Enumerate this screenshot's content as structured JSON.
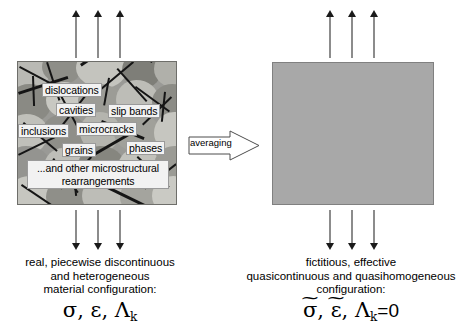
{
  "diagram": {
    "averaging_arrow": {
      "label": "averaging"
    },
    "left_panel": {
      "name": "micrograph",
      "microstructure_labels": [
        "dislocations",
        "cavities",
        "slip bands",
        "inclusions",
        "microcracks",
        "grains",
        "phases",
        "...and other microstructural rearrangements"
      ],
      "caption_lines": [
        "real, piecewise discontinuous",
        "and heterogeneous",
        "material configuration:"
      ],
      "formula": {
        "stress": "σ",
        "strain": "ε",
        "internal_var": "Λ",
        "internal_var_sub": "k",
        "comma": ", "
      }
    },
    "right_panel": {
      "name": "effective-medium",
      "caption_lines": [
        "fictitious, effective",
        "quasicontinuous and quasihomogeneous",
        "configuration:"
      ],
      "formula": {
        "stress": "σ",
        "strain": "ε",
        "internal_var": "Λ",
        "internal_var_sub": "k",
        "tilde": "~",
        "comma": ", ",
        "equals_zero": "=0"
      }
    },
    "load_arrows": {
      "top_left_count": 3,
      "top_right_count": 3,
      "bottom_left_count": 3,
      "bottom_right_count": 3,
      "direction_top": "up",
      "direction_bottom": "down"
    },
    "colors": {
      "background": "#ffffff",
      "effective_fill": "#a8a8a8",
      "effective_border": "#808080",
      "micrograph_border": "#6e6e6a",
      "label_fill": "#f2f2f2",
      "label_border": "#9a9a9a",
      "arrow_stroke": "#1a1a1a",
      "text": "#000000"
    }
  }
}
